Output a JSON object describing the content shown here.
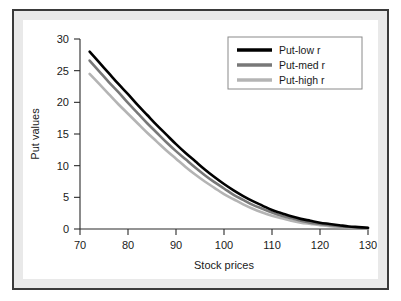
{
  "figure": {
    "frame_border_color": "#3a3a3a",
    "outer_margin_color": "#e9e9e9",
    "canvas_color": "#ffffff"
  },
  "chart_data": {
    "type": "line",
    "title": "",
    "xlabel": "Stock prices",
    "ylabel": "Put values",
    "xlim": [
      70,
      130
    ],
    "ylim": [
      0,
      30
    ],
    "xticks": [
      70,
      80,
      90,
      100,
      110,
      120,
      130
    ],
    "yticks": [
      0,
      5,
      10,
      15,
      20,
      25,
      30
    ],
    "grid": false,
    "legend_position": "top-right",
    "x": [
      72,
      74,
      76,
      78,
      80,
      82,
      84,
      86,
      88,
      90,
      92,
      94,
      96,
      98,
      100,
      102,
      104,
      106,
      108,
      110,
      112,
      114,
      116,
      118,
      120,
      122,
      124,
      126,
      128,
      130
    ],
    "series": [
      {
        "name": "Put-low r",
        "color": "#000000",
        "width": 2.6,
        "values": [
          28.0,
          26.3,
          24.6,
          22.9,
          21.3,
          19.6,
          18.0,
          16.4,
          14.9,
          13.4,
          12.0,
          10.7,
          9.4,
          8.2,
          7.1,
          6.1,
          5.2,
          4.4,
          3.7,
          3.0,
          2.5,
          2.0,
          1.6,
          1.3,
          1.0,
          0.8,
          0.6,
          0.4,
          0.3,
          0.2
        ]
      },
      {
        "name": "Put-med r",
        "color": "#787878",
        "width": 2.6,
        "values": [
          26.6,
          24.9,
          23.2,
          21.6,
          19.9,
          18.3,
          16.7,
          15.2,
          13.7,
          12.3,
          11.0,
          9.7,
          8.5,
          7.4,
          6.4,
          5.4,
          4.6,
          3.8,
          3.2,
          2.6,
          2.1,
          1.7,
          1.3,
          1.0,
          0.8,
          0.6,
          0.45,
          0.32,
          0.22,
          0.15
        ]
      },
      {
        "name": "Put-high r",
        "color": "#b4b4b4",
        "width": 2.6,
        "values": [
          24.5,
          22.9,
          21.3,
          19.7,
          18.2,
          16.7,
          15.2,
          13.8,
          12.4,
          11.1,
          9.8,
          8.6,
          7.5,
          6.5,
          5.5,
          4.7,
          3.9,
          3.2,
          2.6,
          2.1,
          1.7,
          1.3,
          1.0,
          0.8,
          0.6,
          0.45,
          0.32,
          0.22,
          0.15,
          0.1
        ]
      }
    ]
  },
  "legend": {
    "entries": [
      {
        "label": "Put-low r",
        "color": "#000000"
      },
      {
        "label": "Put-med r",
        "color": "#787878"
      },
      {
        "label": "Put-high r",
        "color": "#b4b4b4"
      }
    ]
  }
}
